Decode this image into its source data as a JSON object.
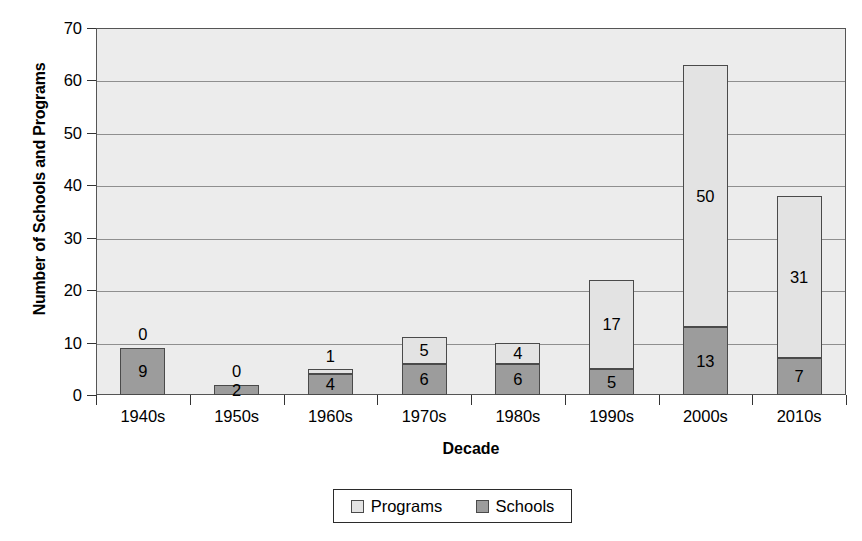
{
  "chart_data": {
    "type": "bar",
    "subtype": "stacked-vertical",
    "title": "",
    "xlabel": "Decade",
    "ylabel": "Number of Schools and Programs",
    "categories": [
      "1940s",
      "1950s",
      "1960s",
      "1970s",
      "1980s",
      "1990s",
      "2000s",
      "2010s"
    ],
    "series": [
      {
        "name": "Schools",
        "values": [
          9,
          2,
          4,
          6,
          6,
          5,
          13,
          7
        ],
        "color": "#9c9c9c"
      },
      {
        "name": "Programs",
        "values": [
          0,
          0,
          1,
          5,
          4,
          17,
          50,
          31
        ],
        "color": "#e3e3e3"
      }
    ],
    "totals": [
      9,
      2,
      5,
      11,
      10,
      22,
      63,
      38
    ],
    "ylim": [
      0,
      70
    ],
    "ytick_values": [
      0,
      10,
      20,
      30,
      40,
      50,
      60,
      70
    ],
    "ytick_labels": [
      "0",
      "10",
      "20",
      "30",
      "40",
      "50",
      "60",
      "70"
    ],
    "grid": true,
    "legend_position": "bottom",
    "legend_entries": [
      "Programs",
      "Schools"
    ],
    "plot_background": "#ececec",
    "axis_color": "#555555",
    "gridline_color": "#8f8f8f"
  },
  "axes": {
    "y_title": "Number of Schools and Programs",
    "x_title": "Decade"
  },
  "legend": {
    "items": [
      {
        "label": "Programs",
        "color": "#e3e3e3"
      },
      {
        "label": "Schools",
        "color": "#9c9c9c"
      }
    ]
  }
}
